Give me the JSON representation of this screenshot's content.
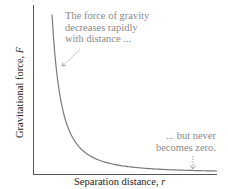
{
  "chart_data": {
    "type": "line",
    "title": "",
    "xlabel": "Separation distance, r",
    "ylabel": "Gravitational force, F",
    "xlabel_text": "Separation distance, ",
    "xlabel_var": "r",
    "ylabel_text": "Gravitational force, ",
    "ylabel_var": "F",
    "grid": false,
    "legend": null,
    "ticks": "none",
    "series": [
      {
        "name": "F ∝ 1/r²",
        "x": [
          1.0,
          1.2,
          1.5,
          2.0,
          2.5,
          3.0,
          4.0,
          5.0,
          6.0,
          7.0,
          8.0,
          9.0,
          10.0
        ],
        "values": [
          1.0,
          0.694,
          0.444,
          0.25,
          0.16,
          0.111,
          0.0625,
          0.04,
          0.0278,
          0.0204,
          0.0156,
          0.0123,
          0.01
        ]
      }
    ],
    "annotations": [
      {
        "lines": [
          "The force of gravity",
          "decreases rapidly",
          "with distance ..."
        ],
        "arrow_target": "steep part of curve"
      },
      {
        "lines": [
          "... but never",
          "becomes zero."
        ],
        "arrow_target": "flat tail of curve near x-axis"
      }
    ]
  },
  "colors": {
    "axis": "#555555",
    "curve": "#7a7a7a",
    "annotation_text": "#8a8a8a",
    "label_text": "#222222"
  }
}
